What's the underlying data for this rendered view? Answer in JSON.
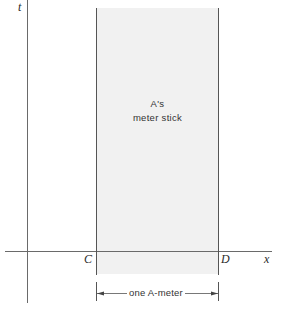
{
  "diagram": {
    "axes": {
      "vertical_label": "t",
      "horizontal_label": "x"
    },
    "points": {
      "left_end": "C",
      "right_end": "D"
    },
    "region": {
      "label_line1": "A's",
      "label_line2": "meter stick",
      "fill_color": "#f1f1f1"
    },
    "dimension": {
      "label": "one A-meter"
    },
    "colors": {
      "line": "#555555",
      "text": "#2a2a2a"
    }
  }
}
